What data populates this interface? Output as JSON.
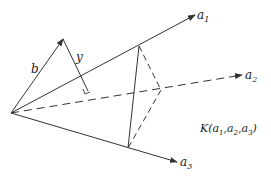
{
  "diagram": {
    "colors": {
      "line": "#333333",
      "text": "#222222",
      "background": "#ffffff"
    },
    "origin": [
      11,
      113
    ],
    "vectors": [
      {
        "id": "a1",
        "label": "a",
        "sub": "1",
        "tip": [
          195,
          15
        ],
        "style": "solid",
        "label_pos": [
          197,
          19
        ]
      },
      {
        "id": "a2",
        "label": "a",
        "sub": "2",
        "tip": [
          242,
          75
        ],
        "style": "dashed",
        "label_pos": [
          245,
          79
        ]
      },
      {
        "id": "a3",
        "label": "a",
        "sub": "3",
        "tip": [
          177,
          162
        ],
        "style": "solid",
        "label_pos": [
          180,
          166
        ]
      },
      {
        "id": "b",
        "label": "b",
        "tip": [
          63,
          39
        ],
        "style": "solid",
        "label_pos": [
          33,
          72
        ]
      }
    ],
    "y_segment": {
      "label": "y",
      "from": [
        63,
        39
      ],
      "to": [
        88,
        91
      ],
      "label_pos": [
        77,
        60
      ]
    },
    "triangle": {
      "p1": [
        139,
        46
      ],
      "p2": [
        161,
        90
      ],
      "p3": [
        128,
        148
      ]
    },
    "cone_label": {
      "text_main": "K(",
      "parts": [
        "a",
        "1",
        ",",
        "a",
        "2",
        ",",
        "a",
        "3",
        ")"
      ],
      "pos": [
        200,
        132
      ]
    }
  }
}
